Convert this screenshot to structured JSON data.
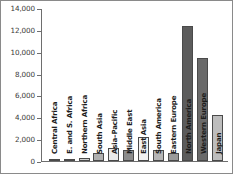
{
  "chart_data": {
    "type": "bar",
    "title": "",
    "xlabel": "",
    "ylabel": "",
    "ylim": [
      0,
      14000
    ],
    "grid": false,
    "legend": "none",
    "ytick_labels": [
      "14,000",
      "12,000",
      "10,000",
      "8,000",
      "6,000",
      "4,000",
      "2,000",
      "0"
    ],
    "ytick_values": [
      14000,
      12000,
      10000,
      8000,
      6000,
      4000,
      2000,
      0
    ],
    "categories": [
      "Central Africa",
      "E. and S. Africa",
      "Northern Africa",
      "South Asia",
      "Asia–Pacific",
      "Middle East",
      "East Asia",
      "South America",
      "Eastern Europe",
      "North America",
      "Western Europe",
      "Japan"
    ],
    "values": [
      80,
      200,
      320,
      700,
      1200,
      1050,
      2200,
      1050,
      750,
      12400,
      9500,
      4200
    ],
    "bar_colors": [
      "#b9b9b9",
      "#8f8f8f",
      "#d2d2d2",
      "#b0b0b0",
      "#eaeaea",
      "#8c8c8c",
      "#f2f2f2",
      "#b5b5b5",
      "#9a9a9a",
      "#5c5c5c",
      "#6a6a6a",
      "#bdbdbd"
    ],
    "bar_edge_color": "#4a4a4a",
    "axis_color": "#6e6e6e",
    "text_color": "#1c1c1c",
    "tick_label_color": "#3a3a3a",
    "background": "#ffffff"
  }
}
